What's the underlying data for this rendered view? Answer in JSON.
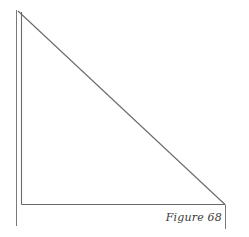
{
  "figure": {
    "caption": "Figure 68",
    "shape": "right-triangle",
    "line_color": "#6a6a6a"
  }
}
